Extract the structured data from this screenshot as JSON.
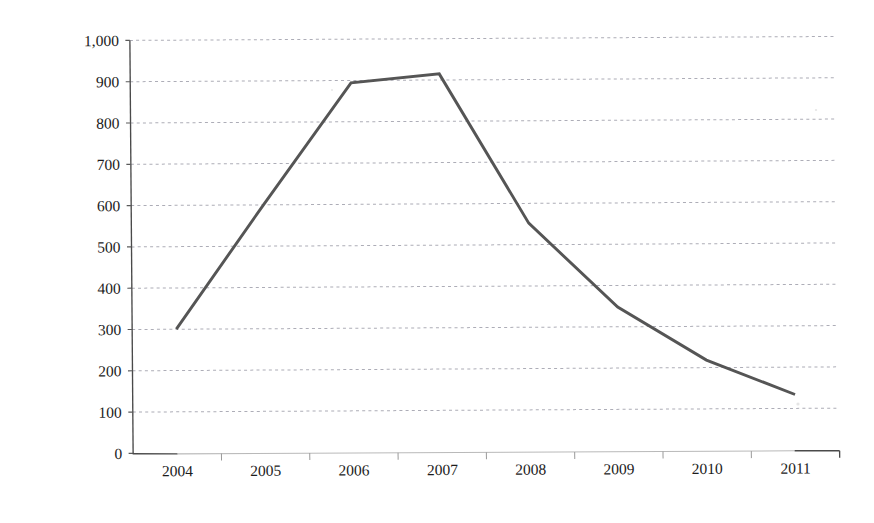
{
  "chart_data": {
    "type": "line",
    "title": "",
    "subtitle": "",
    "xlabel": "",
    "ylabel": "",
    "categories": [
      "2004",
      "2005",
      "2006",
      "2007",
      "2008",
      "2009",
      "2010",
      "2011"
    ],
    "series": [
      {
        "name": "series-1",
        "color": "#555555",
        "values": [
          300,
          600,
          893,
          913,
          550,
          345,
          215,
          130
        ]
      }
    ],
    "ylim": [
      0,
      1000
    ],
    "ytick_values": [
      0,
      100,
      200,
      300,
      400,
      500,
      600,
      700,
      800,
      900,
      1000
    ],
    "ytick_labels": [
      "0",
      "100",
      "200",
      "300",
      "400",
      "500",
      "600",
      "700",
      "800",
      "900",
      "1,000"
    ],
    "grid": true,
    "grid_axis": "y",
    "grid_style": "dotted",
    "legend": false,
    "legend_position": "none",
    "markers": false,
    "annotations": []
  },
  "axes": {
    "y_axis_name": "y-axis",
    "x_axis_name": "x-axis"
  },
  "colors": {
    "line": "#555555",
    "gridline": "#8e8e9c",
    "axis": "#4a4a4a",
    "text": "#1c1c1c",
    "background": "#ffffff"
  }
}
